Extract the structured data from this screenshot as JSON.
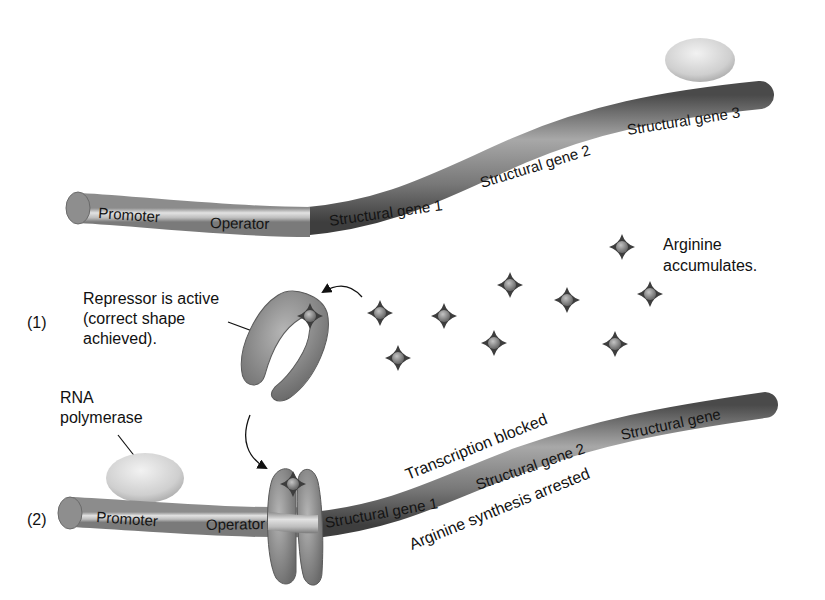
{
  "diagram": {
    "colors": {
      "background": "#ffffff",
      "tube_light": "#c9c9c9",
      "tube_dark": "#6e6e6e",
      "repressor": "#8a8a8a",
      "polymerase": "#d6d6d6",
      "arginine": "#555555",
      "text": "#111111"
    },
    "top_operon": {
      "segments": [
        {
          "label": "Promoter"
        },
        {
          "label": "Operator"
        },
        {
          "label": "Structural gene 1"
        },
        {
          "label": "Structural gene 2"
        },
        {
          "label": "Structural gene 3"
        }
      ],
      "polymerase_icon": "rna-polymerase-blob"
    },
    "arginine": {
      "label_line1": "Arginine",
      "label_line2": "accumulates.",
      "molecule_icon": "four-point-star-molecule",
      "molecule_count": 9
    },
    "step1": {
      "number": "(1)",
      "label_line1": "Repressor is active",
      "label_line2": "(correct shape",
      "label_line3": "achieved)."
    },
    "step2": {
      "number": "(2)",
      "polymerase_line1": "RNA",
      "polymerase_line2": "polymerase",
      "segments": [
        {
          "label": "Promoter"
        },
        {
          "label": "Operator"
        },
        {
          "label": "Structural gene 1"
        },
        {
          "label": "Structural gene 2"
        },
        {
          "label": "Structural gene"
        }
      ],
      "above_label": "Transcription blocked",
      "below_label": "Arginine synthesis arrested"
    }
  }
}
